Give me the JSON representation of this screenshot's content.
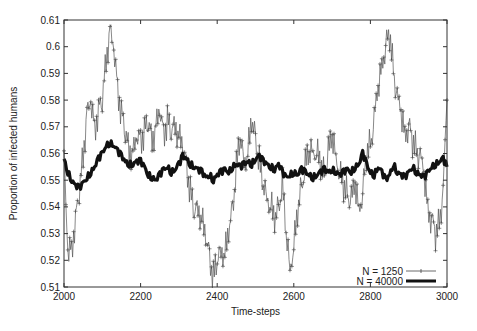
{
  "chart_data": {
    "type": "line",
    "title": "",
    "xlabel": "Time-steps",
    "ylabel": "Proportion of infected humans",
    "xlim": [
      2000,
      3000
    ],
    "ylim": [
      0.51,
      0.61
    ],
    "xticks": [
      "2000",
      "2200",
      "2400",
      "2600",
      "2800",
      "3000"
    ],
    "yticks": [
      "0.51",
      "0.52",
      "0.53",
      "0.54",
      "0.55",
      "0.56",
      "0.57",
      "0.58",
      "0.59",
      "0.6",
      "0.61"
    ],
    "grid": false,
    "legend_position": "lower right",
    "x": [
      2000,
      2010,
      2020,
      2030,
      2040,
      2050,
      2060,
      2070,
      2080,
      2090,
      2100,
      2110,
      2120,
      2130,
      2140,
      2150,
      2160,
      2170,
      2180,
      2190,
      2200,
      2210,
      2220,
      2230,
      2240,
      2250,
      2260,
      2270,
      2280,
      2290,
      2300,
      2310,
      2320,
      2330,
      2340,
      2350,
      2360,
      2370,
      2380,
      2390,
      2400,
      2410,
      2420,
      2430,
      2440,
      2450,
      2460,
      2470,
      2480,
      2490,
      2500,
      2510,
      2520,
      2530,
      2540,
      2550,
      2560,
      2570,
      2580,
      2590,
      2600,
      2610,
      2620,
      2630,
      2640,
      2650,
      2660,
      2670,
      2680,
      2690,
      2700,
      2710,
      2720,
      2730,
      2740,
      2750,
      2760,
      2770,
      2780,
      2790,
      2800,
      2810,
      2820,
      2830,
      2840,
      2850,
      2860,
      2870,
      2880,
      2890,
      2900,
      2910,
      2920,
      2930,
      2940,
      2950,
      2960,
      2970,
      2980,
      2990,
      3000
    ],
    "series": [
      {
        "name": "N = 1250",
        "style": "thin line with + markers",
        "values": [
          0.558,
          0.522,
          0.525,
          0.535,
          0.546,
          0.56,
          0.575,
          0.578,
          0.57,
          0.576,
          0.58,
          0.596,
          0.606,
          0.598,
          0.585,
          0.575,
          0.568,
          0.562,
          0.56,
          0.565,
          0.566,
          0.568,
          0.572,
          0.566,
          0.57,
          0.575,
          0.568,
          0.572,
          0.568,
          0.572,
          0.566,
          0.562,
          0.556,
          0.545,
          0.538,
          0.541,
          0.535,
          0.528,
          0.522,
          0.513,
          0.52,
          0.525,
          0.522,
          0.53,
          0.54,
          0.554,
          0.566,
          0.558,
          0.56,
          0.572,
          0.566,
          0.556,
          0.548,
          0.545,
          0.54,
          0.535,
          0.54,
          0.548,
          0.53,
          0.518,
          0.525,
          0.538,
          0.548,
          0.555,
          0.56,
          0.562,
          0.56,
          0.556,
          0.552,
          0.56,
          0.566,
          0.56,
          0.552,
          0.548,
          0.545,
          0.542,
          0.548,
          0.54,
          0.545,
          0.56,
          0.564,
          0.572,
          0.584,
          0.594,
          0.6,
          0.605,
          0.592,
          0.58,
          0.575,
          0.568,
          0.57,
          0.565,
          0.562,
          0.558,
          0.552,
          0.54,
          0.535,
          0.53,
          0.535,
          0.545,
          0.58
        ]
      },
      {
        "name": "N = 40000",
        "style": "thick solid line",
        "values": [
          0.558,
          0.553,
          0.55,
          0.548,
          0.547,
          0.549,
          0.551,
          0.553,
          0.555,
          0.558,
          0.56,
          0.563,
          0.564,
          0.563,
          0.561,
          0.559,
          0.557,
          0.556,
          0.556,
          0.557,
          0.557,
          0.555,
          0.552,
          0.551,
          0.55,
          0.552,
          0.554,
          0.555,
          0.553,
          0.554,
          0.556,
          0.559,
          0.558,
          0.556,
          0.555,
          0.554,
          0.553,
          0.551,
          0.552,
          0.55,
          0.552,
          0.553,
          0.554,
          0.553,
          0.555,
          0.556,
          0.555,
          0.556,
          0.557,
          0.556,
          0.558,
          0.559,
          0.557,
          0.556,
          0.555,
          0.554,
          0.556,
          0.553,
          0.551,
          0.552,
          0.553,
          0.552,
          0.554,
          0.553,
          0.552,
          0.551,
          0.552,
          0.553,
          0.554,
          0.553,
          0.554,
          0.553,
          0.552,
          0.553,
          0.554,
          0.553,
          0.555,
          0.556,
          0.56,
          0.556,
          0.553,
          0.552,
          0.555,
          0.553,
          0.55,
          0.552,
          0.556,
          0.553,
          0.552,
          0.551,
          0.553,
          0.555,
          0.553,
          0.552,
          0.551,
          0.553,
          0.555,
          0.556,
          0.557,
          0.558,
          0.555
        ]
      }
    ]
  },
  "legend": {
    "items": [
      {
        "label": "N = 1250"
      },
      {
        "label": "N = 40000"
      }
    ]
  }
}
